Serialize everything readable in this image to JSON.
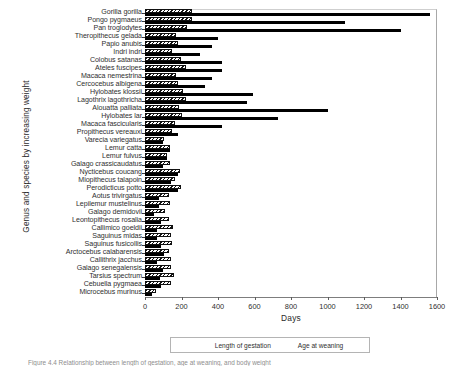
{
  "figure": {
    "caption": "Figure 4.4  Relationship between length of gestation, age at weaning, and body weight"
  },
  "legend": {
    "position": "bottom-center",
    "items": [
      {
        "label": "Length of gestation",
        "key": "gestation",
        "swatch": "hatched-swatch"
      },
      {
        "label": "Age at weaning",
        "key": "weaning",
        "swatch": "solid-black-swatch"
      }
    ]
  },
  "chart_data": {
    "type": "bar",
    "orientation": "horizontal",
    "title": "",
    "xlabel": "Days",
    "ylabel": "Genus and species by increasing weight",
    "xlim": [
      0,
      1600
    ],
    "xticks": [
      0,
      200,
      400,
      600,
      800,
      1000,
      1200,
      1400,
      1600
    ],
    "grid": false,
    "categories": [
      "Gorilla gorilla",
      "Pongo pygmaeus",
      "Pan troglodytes",
      "Theropithecus gelada",
      "Papio anubis",
      "Indri indri",
      "Colobus satanas",
      "Ateles fuscipes",
      "Macaca nemestrina",
      "Cercocebus albigena",
      "Hylobates klossii",
      "Lagothrix lagothricha",
      "Alouatta palliata",
      "Hylobates lar",
      "Macaca fascicularis",
      "Propithecus vereauxi",
      "Varecia variegatus",
      "Lemur catta",
      "Lemur fulvus",
      "Galago crassicaudatus",
      "Nycticebus coucang",
      "Miopithecus talapoin",
      "Perodicticus potto",
      "Aotus trivirgatus",
      "Lepilemur mustelinus",
      "Galago demidovii",
      "Leontopithecus rosalia",
      "Callimico goeldii",
      "Saguinus midas",
      "Saguinus fusicollis",
      "Arctocebus calabarensis",
      "Callithrix jacchus",
      "Galago senegalensis",
      "Tarsius spectrum",
      "Cebuella pygmaea",
      "Microcebus murinus"
    ],
    "series": [
      {
        "name": "Length of gestation",
        "color": "#111111",
        "fill": "hatched",
        "values": [
          255,
          260,
          228,
          170,
          180,
          150,
          195,
          226,
          170,
          180,
          210,
          225,
          186,
          205,
          165,
          150,
          102,
          135,
          120,
          135,
          193,
          165,
          195,
          133,
          135,
          111,
          129,
          155,
          145,
          150,
          131,
          144,
          142,
          160,
          141,
          60
        ]
      },
      {
        "name": "Age at weaning",
        "color": "#000000",
        "fill": "solid",
        "values": [
          1561,
          1095,
          1400,
          400,
          365,
          300,
          420,
          420,
          365,
          330,
          590,
          560,
          1000,
          730,
          420,
          180,
          100,
          135,
          120,
          100,
          180,
          140,
          180,
          75,
          75,
          50,
          90,
          65,
          65,
          90,
          105,
          65,
          100,
          80,
          90,
          40
        ]
      }
    ]
  }
}
